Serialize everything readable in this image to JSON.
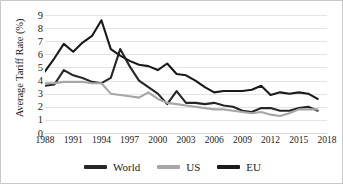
{
  "chart_data": {
    "type": "line",
    "title": "",
    "xlabel": "",
    "ylabel": "Average Tariff Rate (%)",
    "ylim": [
      0,
      9
    ],
    "xlim": [
      1988,
      2018
    ],
    "grid": true,
    "legend_position": "bottom-center",
    "y_ticks": [
      "9",
      "8",
      "7",
      "6",
      "5",
      "4",
      "3",
      "2",
      "1",
      "0"
    ],
    "x_ticks": [
      "1988",
      "1991",
      "1994",
      "1997",
      "2000",
      "2003",
      "2006",
      "2009",
      "2012",
      "2015",
      "2018"
    ],
    "x": [
      1988,
      1989,
      1990,
      1991,
      1992,
      1993,
      1994,
      1995,
      1996,
      1997,
      1998,
      1999,
      2000,
      2001,
      2002,
      2003,
      2004,
      2005,
      2006,
      2007,
      2008,
      2009,
      2010,
      2011,
      2012,
      2013,
      2014,
      2015,
      2016,
      2017
    ],
    "series": [
      {
        "name": "World",
        "color": "#262626",
        "values": [
          3.6,
          3.7,
          4.8,
          4.4,
          4.2,
          3.9,
          3.8,
          4.2,
          6.4,
          5.1,
          4.0,
          3.5,
          3.0,
          2.2,
          3.2,
          2.3,
          2.3,
          2.2,
          2.3,
          2.1,
          2.0,
          1.7,
          1.6,
          1.9,
          1.9,
          1.7,
          1.7,
          1.9,
          2.0,
          1.7
        ]
      },
      {
        "name": "US",
        "color": "#a6a6a6",
        "values": [
          3.8,
          3.8,
          3.9,
          3.9,
          3.9,
          3.8,
          3.8,
          3.0,
          2.9,
          2.8,
          2.7,
          3.1,
          2.6,
          2.3,
          2.2,
          2.1,
          2.0,
          1.9,
          1.8,
          1.8,
          1.7,
          1.6,
          1.5,
          1.6,
          1.4,
          1.3,
          1.5,
          1.8,
          1.8,
          1.8
        ]
      },
      {
        "name": "EU",
        "color": "#1a1a1a",
        "values": [
          4.7,
          5.7,
          6.8,
          6.2,
          6.9,
          7.4,
          8.6,
          6.4,
          5.9,
          5.5,
          5.2,
          5.1,
          4.8,
          5.3,
          4.5,
          4.4,
          4.0,
          3.5,
          3.1,
          3.2,
          3.2,
          3.2,
          3.3,
          3.6,
          2.9,
          3.1,
          3.0,
          3.1,
          3.0,
          2.6
        ]
      }
    ],
    "legend": [
      {
        "label": "World",
        "color": "#262626"
      },
      {
        "label": "US",
        "color": "#a6a6a6"
      },
      {
        "label": "EU",
        "color": "#1a1a1a"
      }
    ]
  }
}
